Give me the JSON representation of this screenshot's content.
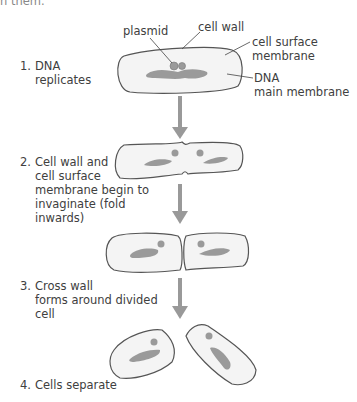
{
  "header_fragment": "n them.",
  "labels": {
    "plasmid": "plasmid",
    "cell_wall": "cell wall",
    "cell_surface_membrane_1": "cell surface",
    "cell_surface_membrane_2": "membrane",
    "dna_1": "DNA",
    "dna_2": "main membrane"
  },
  "steps": [
    {
      "number": "1.",
      "lines": [
        "DNA",
        "replicates"
      ]
    },
    {
      "number": "2.",
      "lines": [
        "Cell wall and",
        "cell surface",
        "membrane begin to",
        "invaginate (fold",
        "inwards)"
      ]
    },
    {
      "number": "3.",
      "lines": [
        "Cross wall",
        "forms around divided",
        "cell"
      ]
    },
    {
      "number": "4.",
      "lines": [
        "Cells separate"
      ]
    }
  ],
  "colors": {
    "cell_fill": "#f4f4f4",
    "cell_outline": "#555555",
    "dna": "#9a9a9a",
    "arrow": "#999999",
    "text": "#404040"
  }
}
